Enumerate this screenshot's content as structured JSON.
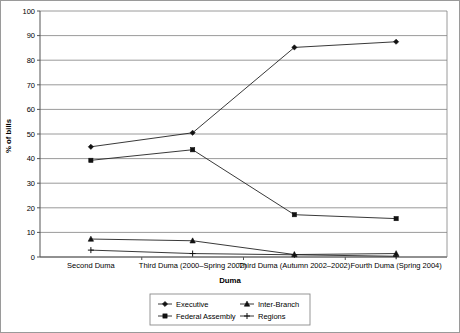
{
  "chart_data": {
    "type": "line",
    "title": "",
    "xlabel": "Duma",
    "ylabel": "% of bills",
    "ylim": [
      0,
      100
    ],
    "ytick_step": 10,
    "yticks": [
      "0",
      "10",
      "20",
      "30",
      "40",
      "50",
      "60",
      "70",
      "80",
      "90",
      "100"
    ],
    "grid": true,
    "legend_position": "bottom",
    "categories": [
      "Second Duma",
      "Third Duma (2000–Spring 2002)",
      "Third Duma (Autumn 2002–2002)",
      "Fourth Duma (Spring 2004)"
    ],
    "series": [
      {
        "name": "Executive",
        "marker": "diamond",
        "values": [
          44.8,
          50.5,
          85.2,
          87.5
        ]
      },
      {
        "name": "Federal Assembly",
        "marker": "square",
        "values": [
          39.3,
          43.6,
          17.2,
          15.6
        ]
      },
      {
        "name": "Inter-Branch",
        "marker": "triangle",
        "values": [
          7.3,
          6.6,
          1.0,
          1.4
        ]
      },
      {
        "name": "Regions",
        "marker": "cross",
        "values": [
          2.8,
          1.4,
          0.9,
          0.3
        ]
      }
    ]
  },
  "legend": {
    "entries": [
      {
        "label": "Executive"
      },
      {
        "label": "Inter-Branch"
      },
      {
        "label": "Federal Assembly"
      },
      {
        "label": "Regions"
      }
    ]
  },
  "colors": {
    "line": "#222222",
    "marker": "#111111",
    "grid": "#808080",
    "axis": "#555555",
    "frame": "#9a9a9a",
    "background": "#ffffff"
  }
}
